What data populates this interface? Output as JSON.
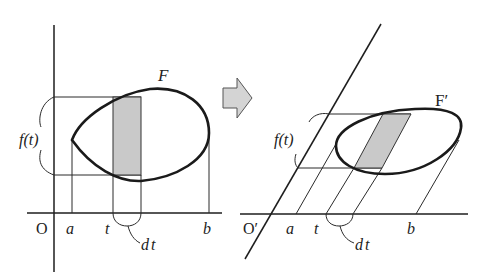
{
  "figure": {
    "colors": {
      "ink": "#222222",
      "shade": "#c9c9c9",
      "arrow_fill": "#d4d4d4",
      "background": "#ffffff"
    }
  },
  "left_panel": {
    "region_label": "F",
    "origin_label": "O",
    "ticks": {
      "a": "a",
      "t": "t",
      "b": "b"
    },
    "slice_length_label": "f(t)",
    "width_label": "dt"
  },
  "arrow": {
    "icon": "right-arrow-icon"
  },
  "right_panel": {
    "region_label": "F′",
    "origin_label": "O′",
    "ticks": {
      "a": "a",
      "t": "t",
      "b": "b"
    },
    "slice_length_label": "f(t)",
    "width_label": "dt"
  }
}
